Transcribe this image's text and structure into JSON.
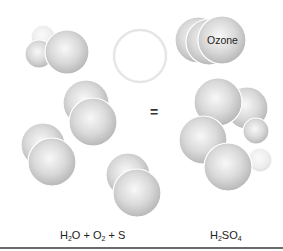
{
  "diagram": {
    "title": "",
    "equals_sign": "=",
    "left_label": {
      "parts": [
        {
          "text": "H",
          "sub": "2"
        },
        {
          "text": "O + O",
          "sub": "2"
        },
        {
          "text": " + S",
          "sub": ""
        }
      ],
      "plain": "H2O + O2 + S"
    },
    "right_label": {
      "parts": [
        {
          "text": "H",
          "sub": "2"
        },
        {
          "text": "SO",
          "sub": "4"
        }
      ],
      "plain": "H2SO4"
    },
    "ozone_label": "Ozone",
    "colors": {
      "sphere_light": "#f7f7f7",
      "sphere_mid": "#d6d6d6",
      "sphere_dark": "#b8b8b8",
      "rim": "#ffffff",
      "rule": "#6a6a6a"
    },
    "molecules": [
      {
        "name": "water",
        "side": "left",
        "spheres": [
          {
            "cx": 43,
            "cy": 37,
            "r": 12,
            "faint": true
          },
          {
            "cx": 39,
            "cy": 54,
            "r": 14
          },
          {
            "cx": 67,
            "cy": 52,
            "r": 22
          }
        ]
      },
      {
        "name": "empty-circle",
        "side": "left",
        "spheres": [
          {
            "cx": 140,
            "cy": 56,
            "r": 26,
            "outline": true
          }
        ]
      },
      {
        "name": "oxygen-pair-1",
        "side": "left",
        "spheres": [
          {
            "cx": 86,
            "cy": 103,
            "r": 23
          },
          {
            "cx": 93,
            "cy": 122,
            "r": 24
          }
        ]
      },
      {
        "name": "oxygen-pair-2",
        "side": "left",
        "spheres": [
          {
            "cx": 43,
            "cy": 145,
            "r": 22
          },
          {
            "cx": 52,
            "cy": 162,
            "r": 24
          }
        ]
      },
      {
        "name": "oxygen-pair-3",
        "side": "left",
        "spheres": [
          {
            "cx": 128,
            "cy": 175,
            "r": 22
          },
          {
            "cx": 137,
            "cy": 193,
            "r": 24
          }
        ]
      },
      {
        "name": "ozone",
        "side": "right",
        "spheres": [
          {
            "cx": 198,
            "cy": 40,
            "r": 23
          },
          {
            "cx": 209,
            "cy": 42,
            "r": 23
          },
          {
            "cx": 222,
            "cy": 40,
            "r": 24
          }
        ]
      },
      {
        "name": "sulfuric-acid",
        "side": "right",
        "spheres": [
          {
            "cx": 247,
            "cy": 108,
            "r": 21
          },
          {
            "cx": 260,
            "cy": 160,
            "r": 12,
            "faint": true
          },
          {
            "cx": 218,
            "cy": 102,
            "r": 24
          },
          {
            "cx": 256,
            "cy": 131,
            "r": 13
          },
          {
            "cx": 203,
            "cy": 140,
            "r": 24
          },
          {
            "cx": 228,
            "cy": 167,
            "r": 24
          }
        ]
      }
    ]
  }
}
